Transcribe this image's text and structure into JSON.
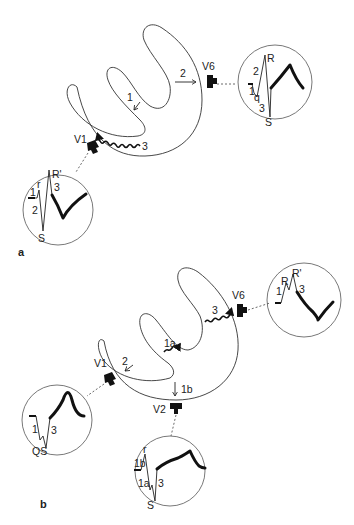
{
  "figure": {
    "panels": [
      {
        "id": "a",
        "panel_label": "a",
        "leads": [
          {
            "name": "V1",
            "label": "V1",
            "waveform_labels": [
              "1",
              "r",
              "R'",
              "2",
              "3",
              "S"
            ]
          },
          {
            "name": "V6",
            "label": "V6",
            "waveform_labels": [
              "R",
              "2",
              "1",
              "q",
              "3",
              "S"
            ]
          }
        ],
        "heart_arrows": [
          {
            "label": "1",
            "type": "straight"
          },
          {
            "label": "2",
            "type": "straight"
          },
          {
            "label": "3",
            "type": "wavy"
          }
        ]
      },
      {
        "id": "b",
        "panel_label": "b",
        "leads": [
          {
            "name": "V1",
            "label": "V1",
            "waveform_labels": [
              "1",
              "3",
              "QS"
            ]
          },
          {
            "name": "V2",
            "label": "V2",
            "waveform_labels": [
              "r",
              "1b",
              "1a",
              "3",
              "S"
            ]
          },
          {
            "name": "V6",
            "label": "V6",
            "waveform_labels": [
              "R",
              "R'",
              "1",
              "3"
            ]
          }
        ],
        "heart_arrows": [
          {
            "label": "1a",
            "type": "wavy"
          },
          {
            "label": "1b",
            "type": "straight"
          },
          {
            "label": "2",
            "type": "straight"
          },
          {
            "label": "3",
            "type": "wavy"
          }
        ]
      }
    ]
  },
  "a": {
    "panel_label": "a",
    "v1": {
      "lead": "V1",
      "l1": "1",
      "r": "r",
      "rp": "R'",
      "l2": "2",
      "l3": "3",
      "s": "S"
    },
    "v6": {
      "lead": "V6",
      "r": "R",
      "l2": "2",
      "l1": "1",
      "q": "q",
      "l3": "3",
      "s": "S"
    },
    "arrows": {
      "a1": "1",
      "a2": "2",
      "a3": "3"
    }
  },
  "b": {
    "panel_label": "b",
    "v1": {
      "lead": "V1",
      "l1": "1",
      "l3": "3",
      "qs": "QS"
    },
    "v2": {
      "lead": "V2",
      "r": "r",
      "l1b": "1b",
      "l1a": "1a",
      "l3": "3",
      "s": "S"
    },
    "v6": {
      "lead": "V6",
      "r": "R",
      "rp": "R'",
      "l1": "1",
      "l3": "3"
    },
    "arrows": {
      "a1a": "1a",
      "a1b": "1b",
      "a2": "2",
      "a3": "3"
    }
  }
}
